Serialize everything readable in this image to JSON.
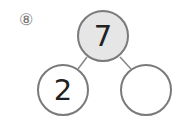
{
  "problem": {
    "number_label": "⑧"
  },
  "number_bond": {
    "whole": {
      "value": "7",
      "fill": "#e6e6e6"
    },
    "parts": [
      {
        "value": "2"
      },
      {
        "value": ""
      }
    ],
    "stroke_color": "#7a7a7a"
  }
}
